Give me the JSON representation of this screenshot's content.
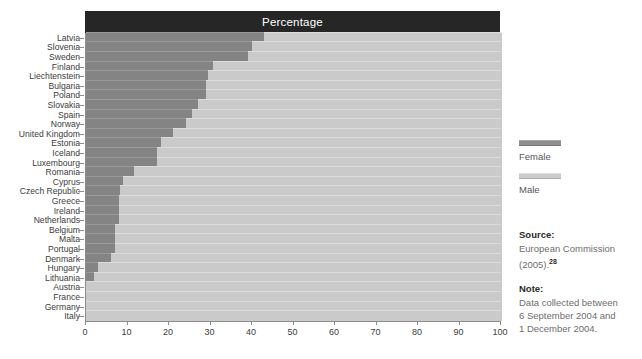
{
  "chart_data": {
    "type": "bar",
    "orientation": "horizontal",
    "stacked": true,
    "normalized": true,
    "title": "Percentage",
    "xlabel": "",
    "ylabel": "",
    "xlim": [
      0,
      100
    ],
    "xticks": [
      0,
      10,
      20,
      30,
      40,
      50,
      60,
      70,
      80,
      90,
      100
    ],
    "xtick_labels": [
      "0",
      "10",
      "20",
      "30",
      "40",
      "50",
      "60",
      "70",
      "80",
      "90",
      "100"
    ],
    "grid": true,
    "legend_position": "right",
    "categories": [
      "Latvia",
      "Slovenia",
      "Sweden",
      "Finland",
      "Liechtenstein",
      "Bulgaria",
      "Poland",
      "Slovakia",
      "Spain",
      "Norway",
      "United Kingdom",
      "Estonia",
      "Iceland",
      "Luxembourg",
      "Romania",
      "Cyprus",
      "Czech Republic",
      "Greece",
      "Ireland",
      "Netherlands",
      "Belgium",
      "Malta",
      "Portugal",
      "Denmark",
      "Hungary",
      "Lithuania",
      "Austria",
      "France",
      "Germany",
      "Italy"
    ],
    "series": [
      {
        "name": "Female",
        "color": "#848484",
        "values": [
          43,
          40,
          39,
          30.5,
          29.5,
          29,
          29,
          27,
          25.5,
          24,
          21,
          18,
          17,
          17,
          11.5,
          9,
          8.2,
          8,
          8,
          8,
          7,
          7,
          7,
          6,
          3,
          2,
          0,
          0,
          0,
          0
        ]
      },
      {
        "name": "Male",
        "color": "#cacaca",
        "values": [
          57,
          60,
          61,
          69.5,
          70.5,
          71,
          71,
          73,
          74.5,
          76,
          79,
          82,
          83,
          83,
          88.5,
          91,
          91.8,
          92,
          92,
          92,
          93,
          93,
          93,
          94,
          97,
          98,
          100,
          100,
          100,
          100
        ]
      }
    ]
  },
  "legend": {
    "entries": [
      {
        "label": "Female",
        "swatch": "female"
      },
      {
        "label": "Male",
        "swatch": "male"
      }
    ]
  },
  "notes": {
    "source_heading": "Source:",
    "source_line1": "European Commission",
    "source_line2": "(2005).",
    "source_ref": "28",
    "note_heading": "Note:",
    "note_line1": "Data collected between",
    "note_line2": "6 September 2004 and",
    "note_line3": "1 December 2004."
  },
  "colors": {
    "title_bar_bg": "#262626",
    "title_bar_text": "#ffffff",
    "female": "#848484",
    "male": "#cacaca",
    "gridline": "#bdbdbd",
    "axis": "#8c8c8c"
  }
}
